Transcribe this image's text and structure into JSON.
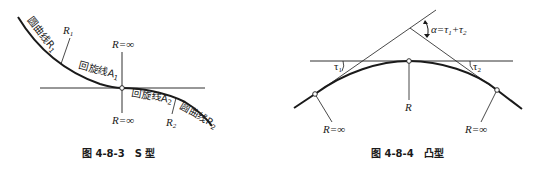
{
  "figures": [
    {
      "id": "fig-4-8-3",
      "caption_number": "图 4-8-3",
      "caption_title": "S 型",
      "labels": {
        "circular_curve_1": "圆曲线R",
        "circular_curve_1_sub": "1",
        "r1": "R",
        "r1_sub": "1",
        "spiral_1": "回旋线A",
        "spiral_1_sub": "1",
        "r_inf_top": "R=∞",
        "r_inf_bottom": "R=∞",
        "spiral_2": "回旋线A",
        "spiral_2_sub": "2",
        "r2": "R",
        "r2_sub": "2",
        "circular_curve_2": "圆曲线R",
        "circular_curve_2_sub": "2"
      }
    },
    {
      "id": "fig-4-8-4",
      "caption_number": "图 4-8-4",
      "caption_title": "凸型",
      "labels": {
        "alpha": "α=τ",
        "alpha_sub1": "1",
        "alpha_plus": "+τ",
        "alpha_sub2": "2",
        "tau1": "τ",
        "tau1_sub": "1",
        "tau2": "τ",
        "tau2_sub": "2",
        "r_center": "R",
        "r_inf_left": "R=∞",
        "r_inf_right": "R=∞"
      }
    }
  ],
  "colors": {
    "line": "#1a1a1a",
    "background": "#ffffff"
  }
}
